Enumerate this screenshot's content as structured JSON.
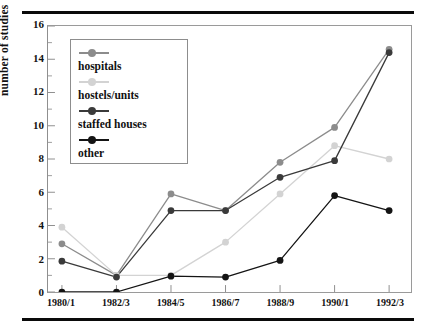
{
  "chart_data": {
    "type": "line",
    "title": "",
    "xlabel": "",
    "ylabel": "number of studies",
    "categories": [
      "1980/1",
      "1982/3",
      "1984/5",
      "1986/7",
      "1988/9",
      "1990/1",
      "1992/3"
    ],
    "ylim": [
      0,
      16
    ],
    "ytick_labels": [
      "0",
      "2",
      "4",
      "6",
      "8",
      "10",
      "12",
      "14",
      "16"
    ],
    "ytick_values": [
      0,
      2,
      4,
      6,
      8,
      10,
      12,
      14,
      16
    ],
    "minor_ytick_values": [
      1,
      3,
      5,
      7,
      9,
      11,
      13,
      15
    ],
    "grid": false,
    "legend_position": "upper-left",
    "series": [
      {
        "name": "hospitals",
        "color": "#8c8c8c",
        "marker": "circle",
        "values": [
          2.9,
          1.0,
          5.9,
          4.9,
          7.8,
          9.9,
          14.6
        ]
      },
      {
        "name": "hostels/units",
        "color": "#d3d3d3",
        "marker": "circle",
        "values": [
          3.9,
          1.0,
          1.0,
          3.0,
          5.9,
          8.8,
          8.0
        ]
      },
      {
        "name": "staffed houses",
        "color": "#3a3a3a",
        "marker": "circle",
        "values": [
          1.85,
          0.9,
          4.9,
          4.9,
          6.9,
          7.9,
          14.4
        ]
      },
      {
        "name": "other",
        "color": "#141414",
        "marker": "circle",
        "values": [
          0.0,
          0.0,
          0.95,
          0.9,
          1.9,
          5.8,
          4.9
        ]
      }
    ]
  },
  "legend": {
    "entries": [
      {
        "label": "hospitals"
      },
      {
        "label": "hostels/units"
      },
      {
        "label": "staffed houses"
      },
      {
        "label": "other"
      }
    ]
  }
}
